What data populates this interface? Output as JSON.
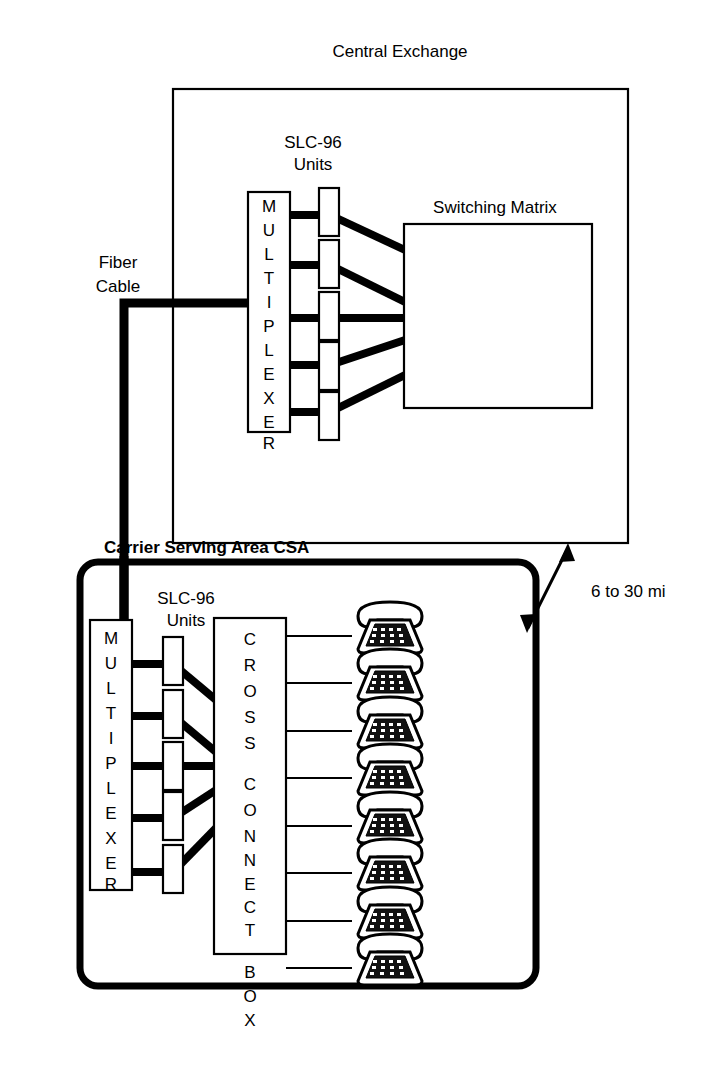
{
  "figure": {
    "title": "Central Exchange",
    "type": "telecom-network-diagram"
  },
  "central_exchange": {
    "title": "Central Exchange",
    "multiplexer_label": "MULTIPLEXER",
    "slc_label_line1": "SLC-96",
    "slc_label_line2": "Units",
    "switching_matrix_label": "Switching Matrix",
    "slc_unit_count": 5
  },
  "fiber": {
    "label_line1": "Fiber",
    "label_line2": "Cable"
  },
  "distance": {
    "label": "6 to 30 mi"
  },
  "csa": {
    "title": "Carrier Serving Area CSA",
    "multiplexer_label": "MULTIPLEXER",
    "slc_label_line1": "SLC-96",
    "slc_label_line2": "Units",
    "cross_connect_label": "CROSS CONNECT BOX",
    "slc_unit_count": 5,
    "phone_count": 8
  },
  "colors": {
    "line": "#000000",
    "background": "#ffffff",
    "keypad": "#111111"
  }
}
